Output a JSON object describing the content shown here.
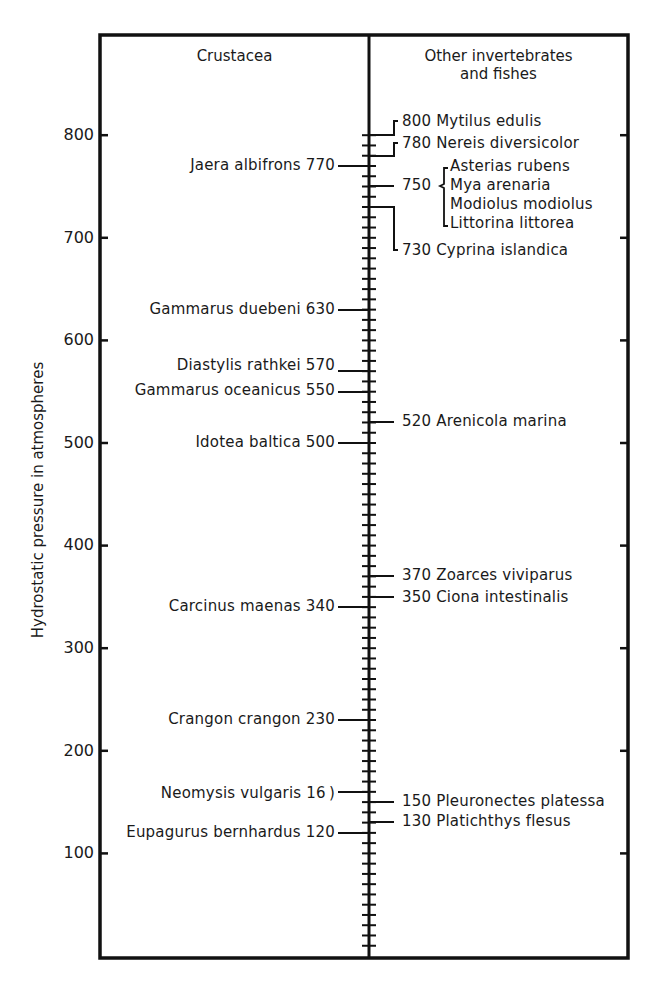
{
  "chart_data": {
    "type": "table",
    "title": "",
    "ylabel": "Hydrostatic pressure in atmospheres",
    "xlabel": "",
    "ylim": [
      0,
      820
    ],
    "yticks": [
      100,
      200,
      300,
      400,
      500,
      600,
      700,
      800
    ],
    "minor_tick_interval": 10,
    "grid": false,
    "columns": [
      "Crustacea",
      "Other invertebrates and fishes"
    ],
    "series": [
      {
        "name": "Crustacea",
        "points": [
          {
            "label": "Jaera albifrons",
            "value": 770
          },
          {
            "label": "Gammarus duebeni",
            "value": 630
          },
          {
            "label": "Diastylis rathkei",
            "value": 570
          },
          {
            "label": "Gammarus oceanicus",
            "value": 550
          },
          {
            "label": "Idotea baltica",
            "value": 500
          },
          {
            "label": "Carcinus maenas",
            "value": 340
          },
          {
            "label": "Crangon crangon",
            "value": 230
          },
          {
            "label": "Neomysis vulgaris",
            "value": 160
          },
          {
            "label": "Eupagurus bernhardus",
            "value": 120
          }
        ]
      },
      {
        "name": "Other invertebrates and fishes",
        "points": [
          {
            "label": "Mytilus edulis",
            "value": 800
          },
          {
            "label": "Nereis diversicolor",
            "value": 780
          },
          {
            "label": "Asterias rubens",
            "value": 750
          },
          {
            "label": "Mya arenaria",
            "value": 750
          },
          {
            "label": "Modiolus modiolus",
            "value": 750
          },
          {
            "label": "Littorina littorea",
            "value": 750
          },
          {
            "label": "Cyprina islandica",
            "value": 730
          },
          {
            "label": "Arenicola marina",
            "value": 520
          },
          {
            "label": "Zoarces viviparus",
            "value": 370
          },
          {
            "label": "Ciona intestinalis",
            "value": 350
          },
          {
            "label": "Pleuronectes platessa",
            "value": 150
          },
          {
            "label": "Platichthys flesus",
            "value": 130
          }
        ]
      }
    ]
  },
  "headers": {
    "left": "Crustacea",
    "right_line1": "Other invertebrates",
    "right_line2": "and fishes"
  },
  "axis": {
    "label": "Hydrostatic pressure in atmospheres",
    "ticks": [
      "100",
      "200",
      "300",
      "400",
      "500",
      "600",
      "700",
      "800"
    ]
  },
  "left_labels": [
    "Jaera albifrons 770",
    "Gammarus duebeni 630",
    "Diastylis rathkei 570",
    "Gammarus oceanicus 550",
    "Idotea baltica 500",
    "Carcinus maenas 340",
    "Crangon crangon 230",
    "Neomysis vulgaris 16 )",
    "Eupagurus bernhardus 120"
  ],
  "right_labels": [
    "800 Mytilus edulis",
    "780 Nereis diversicolor",
    "750",
    "Asterias rubens",
    "Mya arenaria",
    "Modiolus modiolus",
    "Littorina littorea",
    "730 Cyprina islandica",
    "520 Arenicola marina",
    "370 Zoarces viviparus",
    "350 Ciona intestinalis",
    "150 Pleuronectes platessa",
    "130 Platichthys flesus"
  ]
}
